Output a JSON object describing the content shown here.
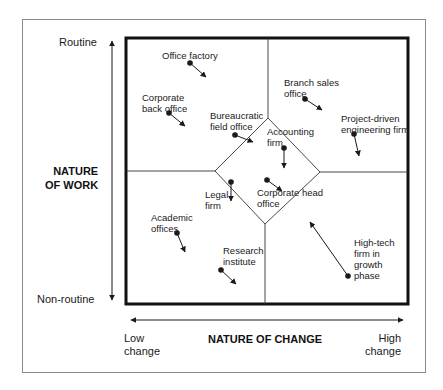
{
  "diagram": {
    "y_axis": {
      "title": "NATURE\nOF WORK",
      "top_label": "Routine",
      "bottom_label": "Non-routine"
    },
    "x_axis": {
      "title": "NATURE OF CHANGE",
      "left_label": "Low\nchange",
      "right_label": "High\nchange"
    },
    "items": [
      {
        "label": "Office factory",
        "dot": [
          190,
          63
        ],
        "arrow_to": [
          206,
          77
        ],
        "label_pos": [
          162,
          50
        ],
        "align": "left"
      },
      {
        "label": "Corporate\nback office",
        "dot": [
          169,
          113
        ],
        "arrow_to": [
          185,
          126
        ],
        "label_pos": [
          142,
          92
        ],
        "align": "left"
      },
      {
        "label": "Bureaucratic\nfield office",
        "dot": [
          235,
          135
        ],
        "arrow_to": [
          253,
          142
        ],
        "label_pos": [
          210,
          110
        ],
        "align": "left"
      },
      {
        "label": "Accounting\nfirm",
        "dot": [
          284,
          148
        ],
        "arrow_to": [
          284,
          168
        ],
        "label_pos": [
          267,
          126
        ],
        "align": "left"
      },
      {
        "label": "Corporate head\noffice",
        "dot": [
          267,
          180
        ],
        "arrow_to": [
          282,
          191
        ],
        "label_pos": [
          257,
          187
        ],
        "align": "left"
      },
      {
        "label": "Legal\nfirm",
        "dot": [
          231,
          182
        ],
        "arrow_to": [
          231,
          201
        ],
        "label_pos": [
          205,
          189
        ],
        "align": "left"
      },
      {
        "label": "Academic\noffices",
        "dot": [
          177,
          233
        ],
        "arrow_to": [
          185,
          252
        ],
        "label_pos": [
          151,
          212
        ],
        "align": "left"
      },
      {
        "label": "Research\ninstitute",
        "dot": [
          221,
          270
        ],
        "arrow_to": [
          236,
          284
        ],
        "label_pos": [
          223,
          245
        ],
        "align": "left"
      },
      {
        "label": "Branch sales\noffice",
        "dot": [
          305,
          99
        ],
        "arrow_to": [
          322,
          110
        ],
        "label_pos": [
          284,
          77
        ],
        "align": "left"
      },
      {
        "label": "Project-driven\nengineering firm",
        "dot": [
          354,
          134
        ],
        "arrow_to": [
          359,
          156
        ],
        "label_pos": [
          341,
          113
        ],
        "align": "left"
      },
      {
        "label": "High-tech\nfirm in\ngrowth\nphase",
        "dot": [
          348,
          276
        ],
        "arrow_to": [
          310,
          222
        ],
        "label_pos": [
          354,
          237
        ],
        "align": "left"
      }
    ],
    "colors": {
      "ink": "#1a1a1a",
      "frame": "#8a8a8a",
      "background": "#ffffff"
    }
  }
}
